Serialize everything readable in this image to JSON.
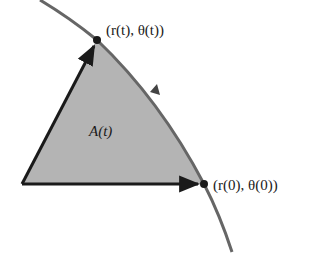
{
  "diagram": {
    "type": "polar-area-swept",
    "labels": {
      "top_point": "(r(t), θ(t))",
      "bottom_point": "(r(0), θ(0))",
      "area": "A(t)"
    },
    "colors": {
      "region_fill": "#b4b4b4",
      "curve": "#666666",
      "vectors": "#1a1a1a",
      "points": "#1a1a1a"
    },
    "geometry": {
      "origin": [
        22,
        184
      ],
      "point_t": [
        97,
        40
      ],
      "point_0": [
        204,
        184
      ],
      "curve_start": [
        40,
        0
      ],
      "curve_end": [
        232,
        252
      ]
    }
  }
}
